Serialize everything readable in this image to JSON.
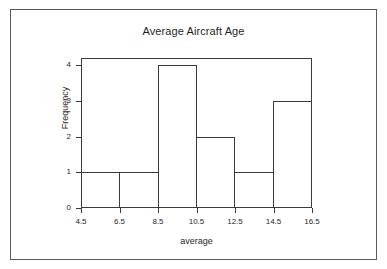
{
  "chart_data": {
    "type": "bar",
    "title": "Average Aircraft Age",
    "xlabel": "average",
    "ylabel": "Frequency",
    "categories": [
      "4.5-6.5",
      "6.5-8.5",
      "8.5-10.5",
      "10.5-12.5",
      "12.5-14.5",
      "14.5-16.5"
    ],
    "values": [
      1,
      1,
      4,
      2,
      1,
      3
    ],
    "bin_edges": [
      4.5,
      6.5,
      8.5,
      10.5,
      12.5,
      14.5,
      16.5
    ],
    "bin_width": 2,
    "xlim": [
      4.5,
      16.5
    ],
    "ylim": [
      0,
      4.2
    ],
    "xticks": [
      "4.5",
      "6.5",
      "8.5",
      "10.5",
      "12.5",
      "14.5",
      "16.5"
    ],
    "xtick_values": [
      4.5,
      6.5,
      8.5,
      10.5,
      12.5,
      14.5,
      16.5
    ],
    "yticks": [
      "0",
      "1",
      "2",
      "3",
      "4"
    ],
    "ytick_values": [
      0,
      1,
      2,
      3,
      4
    ],
    "grid": false,
    "legend": false,
    "bar_fill": "none",
    "line_color": "#3a3a3c",
    "background_color": "#ffffff",
    "text_color": "#1f1f1f"
  }
}
